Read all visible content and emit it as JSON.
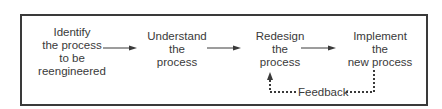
{
  "diagram": {
    "steps": [
      {
        "lines": [
          "Identify",
          "the process",
          "to be",
          "reengineered"
        ]
      },
      {
        "lines": [
          "Understand",
          "the",
          "process"
        ]
      },
      {
        "lines": [
          "Redesign",
          "the",
          "process"
        ]
      },
      {
        "lines": [
          "Implement",
          "the",
          "new process"
        ]
      }
    ],
    "feedback_label": "Feedback",
    "colors": {
      "line": "#3a3a3a",
      "text": "#3a3a3a"
    }
  }
}
